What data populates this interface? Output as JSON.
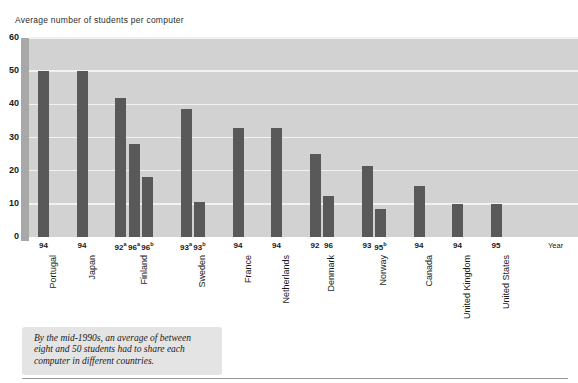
{
  "chart_data": {
    "type": "bar",
    "title": "Average number of students per computer",
    "xlabel": "Year",
    "ylabel": "",
    "ylim": [
      0,
      60
    ],
    "yticks": [
      0,
      10,
      20,
      30,
      40,
      50,
      60
    ],
    "grid": true,
    "legend": null,
    "bar_color": "#595959",
    "plot_background": "#d2d2d2",
    "gridline_color": "#f2f2f2",
    "axis_band_color": "#a8a8a8",
    "groups": [
      {
        "country": "Portugal",
        "bars": [
          {
            "year": "94",
            "sup": "",
            "value": 50.0
          }
        ]
      },
      {
        "country": "Japan",
        "bars": [
          {
            "year": "94",
            "sup": "",
            "value": 50.0
          }
        ]
      },
      {
        "country": "Finland",
        "bars": [
          {
            "year": "92",
            "sup": "a",
            "value": 42.0
          },
          {
            "year": "96",
            "sup": "a",
            "value": 28.0
          },
          {
            "year": "96",
            "sup": "b",
            "value": 18.0
          }
        ]
      },
      {
        "country": "Sweden",
        "bars": [
          {
            "year": "93",
            "sup": "a",
            "value": 38.5
          },
          {
            "year": "93",
            "sup": "b",
            "value": 10.5
          }
        ]
      },
      {
        "country": "France",
        "bars": [
          {
            "year": "94",
            "sup": "",
            "value": 33.0
          }
        ]
      },
      {
        "country": "Netherlands",
        "bars": [
          {
            "year": "94",
            "sup": "",
            "value": 33.0
          }
        ]
      },
      {
        "country": "Denmark",
        "bars": [
          {
            "year": "92",
            "sup": "",
            "value": 25.0
          },
          {
            "year": "96",
            "sup": "",
            "value": 12.5
          }
        ]
      },
      {
        "country": "Norway",
        "bars": [
          {
            "year": "93",
            "sup": "",
            "value": 21.5
          },
          {
            "year": "95",
            "sup": "b",
            "value": 8.5
          }
        ]
      },
      {
        "country": "Canada",
        "bars": [
          {
            "year": "94",
            "sup": "",
            "value": 15.5
          }
        ]
      },
      {
        "country": "United Kingdom",
        "bars": [
          {
            "year": "94",
            "sup": "",
            "value": 10.0
          }
        ]
      },
      {
        "country": "United States",
        "bars": [
          {
            "year": "95",
            "sup": "",
            "value": 10.0
          }
        ]
      }
    ]
  },
  "caption": {
    "text": "By the mid-1990s, an average of between eight and 50 students had to share each computer in different countries."
  }
}
